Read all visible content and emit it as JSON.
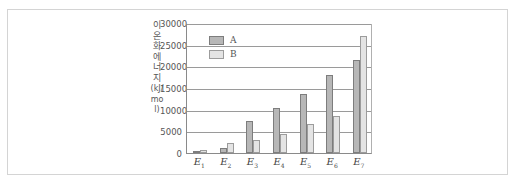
{
  "chart_data": {
    "type": "bar",
    "title": "",
    "xlabel": "",
    "ylabel": "이온화 에너지(kJ/mol)",
    "ylabel_text": "이온화에너지",
    "ylabel_unit": "(kJ/mol)",
    "ylim": [
      0,
      30000
    ],
    "yticks": [
      0,
      5000,
      10000,
      15000,
      20000,
      25000,
      30000
    ],
    "grid": true,
    "legend_position": "upper-left",
    "categories": [
      "E1",
      "E2",
      "E3",
      "E4",
      "E5",
      "E6",
      "E7"
    ],
    "category_labels": [
      {
        "base": "E",
        "sub": "1"
      },
      {
        "base": "E",
        "sub": "2"
      },
      {
        "base": "E",
        "sub": "3"
      },
      {
        "base": "E",
        "sub": "4"
      },
      {
        "base": "E",
        "sub": "5"
      },
      {
        "base": "E",
        "sub": "6"
      },
      {
        "base": "E",
        "sub": "7"
      }
    ],
    "series": [
      {
        "name": "A",
        "color": "#b7b7b7",
        "values": [
          500,
          1200,
          7400,
          10500,
          13600,
          18000,
          21500
        ]
      },
      {
        "name": "B",
        "color": "#e4e4e4",
        "values": [
          800,
          2200,
          3000,
          4300,
          6800,
          8500,
          27100
        ]
      }
    ]
  }
}
